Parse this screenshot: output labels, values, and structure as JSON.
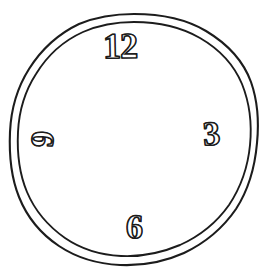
{
  "drawing": {
    "kind": "clock-face-drawing",
    "background_color": "#ffffff",
    "ink_color": "#1c1c1c",
    "ring": {
      "style": "double-outline-hand-drawn",
      "outer_center_x": 134,
      "outer_center_y": 140,
      "outer_radius_x": 124,
      "outer_radius_y": 126,
      "inner_center_x": 134,
      "inner_center_y": 140,
      "inner_radius_x": 117,
      "inner_radius_y": 119
    },
    "numerals": [
      {
        "label": "12",
        "position": "top",
        "clock_hour": 12,
        "x": 129,
        "y": 46,
        "rotation_deg": -1.2
      },
      {
        "label": "3",
        "position": "right",
        "clock_hour": 3,
        "x": 215,
        "y": 134,
        "rotation_deg": -4
      },
      {
        "label": "6",
        "position": "bottom",
        "clock_hour": 6,
        "x": 139,
        "y": 227,
        "rotation_deg": 1.5
      },
      {
        "label": "9",
        "position": "left",
        "clock_hour": 9,
        "x": 47,
        "y": 139,
        "rotation_deg": -86
      }
    ],
    "hands": [],
    "center_dot": false
  }
}
